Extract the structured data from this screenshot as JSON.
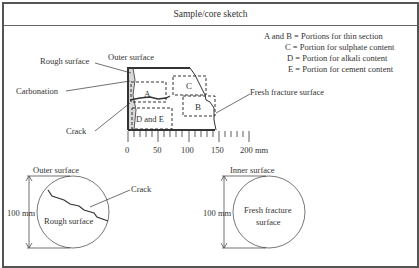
{
  "header": {
    "title": "Sample/core sketch"
  },
  "side_sketch": {
    "labels": {
      "outer_surface": "Outer surface",
      "rough_surface": "Rough surface",
      "carbonation": "Carbonation",
      "crack": "Crack",
      "fresh_fracture_surface": "Fresh fracture surface"
    },
    "portions": {
      "a": "A",
      "b": "B",
      "c": "C",
      "de": "D and E"
    },
    "scale": {
      "ticks": [
        "0",
        "50",
        "100",
        "150",
        "200 mm"
      ]
    }
  },
  "legend": {
    "items": [
      "A and B = Portions for thin section",
      "C = Portion for sulphate content",
      "D = Portion for alkali content",
      "E = Portion for cement content"
    ]
  },
  "outer_view": {
    "title": "Outer surface",
    "dimension": "100 mm",
    "center_label": "Rough surface",
    "crack_label": "Crack"
  },
  "inner_view": {
    "title": "Inner surface",
    "dimension": "100 mm",
    "center_label_line1": "Fresh fracture",
    "center_label_line2": "surface"
  }
}
